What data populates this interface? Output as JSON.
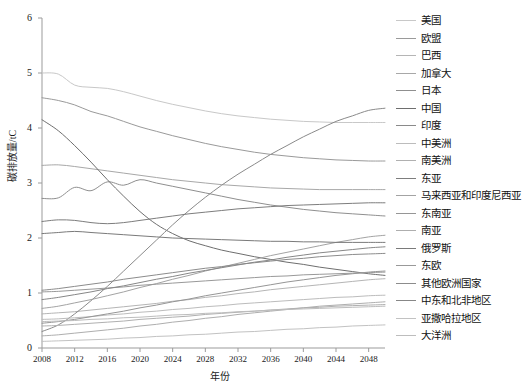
{
  "chart_data": {
    "type": "line",
    "title": "",
    "xlabel": "年份",
    "ylabel": "碳排放量/tC",
    "xlim": [
      2008,
      2050
    ],
    "ylim": [
      0,
      6
    ],
    "grid": false,
    "legend_position": "right",
    "xticks": [
      "2008",
      "2012",
      "2016",
      "2020",
      "2024",
      "2028",
      "2032",
      "2036",
      "2040",
      "2044",
      "2048"
    ],
    "yticks": [
      "0",
      "1",
      "2",
      "3",
      "4",
      "5",
      "6"
    ],
    "x": [
      2008,
      2010,
      2012,
      2014,
      2016,
      2018,
      2020,
      2022,
      2024,
      2026,
      2028,
      2030,
      2032,
      2034,
      2036,
      2038,
      2040,
      2042,
      2044,
      2046,
      2048,
      2050
    ],
    "series": [
      {
        "name": "美国",
        "color": "#c8c8c8",
        "values": [
          5.0,
          4.98,
          4.78,
          4.74,
          4.72,
          4.66,
          4.58,
          4.5,
          4.43,
          4.37,
          4.31,
          4.26,
          4.22,
          4.19,
          4.16,
          4.14,
          4.12,
          4.11,
          4.1,
          4.1,
          4.1,
          4.1
        ]
      },
      {
        "name": "欧盟",
        "color": "#9a9a9a",
        "values": [
          4.55,
          4.5,
          4.42,
          4.3,
          4.22,
          4.12,
          4.02,
          3.94,
          3.86,
          3.79,
          3.72,
          3.66,
          3.61,
          3.56,
          3.52,
          3.49,
          3.46,
          3.44,
          3.42,
          3.41,
          3.4,
          3.4
        ]
      },
      {
        "name": "巴西",
        "color": "#b5b5b5",
        "values": [
          0.62,
          0.64,
          0.66,
          0.69,
          0.72,
          0.75,
          0.78,
          0.81,
          0.85,
          0.88,
          0.92,
          0.95,
          0.99,
          1.02,
          1.06,
          1.09,
          1.12,
          1.15,
          1.18,
          1.21,
          1.24,
          1.26
        ]
      },
      {
        "name": "加拿大",
        "color": "#a8a8a8",
        "values": [
          3.32,
          3.33,
          3.3,
          3.26,
          3.22,
          3.18,
          3.14,
          3.1,
          3.06,
          3.03,
          3.0,
          2.97,
          2.95,
          2.93,
          2.91,
          2.9,
          2.89,
          2.88,
          2.88,
          2.88,
          2.88,
          2.88
        ]
      },
      {
        "name": "日本",
        "color": "#8f8f8f",
        "values": [
          2.72,
          2.73,
          2.92,
          2.86,
          3.02,
          2.96,
          3.06,
          3.0,
          2.94,
          2.88,
          2.82,
          2.76,
          2.7,
          2.65,
          2.6,
          2.56,
          2.52,
          2.49,
          2.46,
          2.44,
          2.42,
          2.4
        ]
      },
      {
        "name": "中国",
        "color": "#6e6e6e",
        "values": [
          4.15,
          3.95,
          3.68,
          3.38,
          3.06,
          2.76,
          2.48,
          2.25,
          2.08,
          1.95,
          1.86,
          1.78,
          1.72,
          1.66,
          1.61,
          1.56,
          1.52,
          1.47,
          1.43,
          1.39,
          1.35,
          1.32
        ]
      },
      {
        "name": "印度",
        "color": "#8a8a8a",
        "values": [
          0.3,
          0.42,
          0.62,
          0.86,
          1.12,
          1.4,
          1.68,
          1.96,
          2.24,
          2.5,
          2.74,
          2.96,
          3.16,
          3.34,
          3.52,
          3.68,
          3.84,
          3.98,
          4.12,
          4.22,
          4.32,
          4.36
        ]
      },
      {
        "name": "中美洲",
        "color": "#bcbcbc",
        "values": [
          0.52,
          0.53,
          0.55,
          0.57,
          0.6,
          0.62,
          0.65,
          0.67,
          0.7,
          0.72,
          0.75,
          0.77,
          0.8,
          0.82,
          0.84,
          0.86,
          0.88,
          0.9,
          0.92,
          0.93,
          0.95,
          0.96
        ]
      },
      {
        "name": "南美洲",
        "color": "#b0b0b0",
        "values": [
          0.4,
          0.41,
          0.43,
          0.45,
          0.47,
          0.49,
          0.52,
          0.54,
          0.56,
          0.58,
          0.61,
          0.63,
          0.65,
          0.67,
          0.69,
          0.71,
          0.73,
          0.74,
          0.76,
          0.77,
          0.78,
          0.79
        ]
      },
      {
        "name": "东亚",
        "color": "#7d7d7d",
        "values": [
          2.3,
          2.33,
          2.32,
          2.28,
          2.26,
          2.28,
          2.32,
          2.36,
          2.4,
          2.44,
          2.47,
          2.5,
          2.53,
          2.55,
          2.57,
          2.59,
          2.6,
          2.61,
          2.62,
          2.63,
          2.64,
          2.64
        ]
      },
      {
        "name": "马来西亚和印度尼西亚",
        "color": "#a3a3a3",
        "values": [
          0.72,
          0.76,
          0.82,
          0.88,
          0.95,
          1.02,
          1.1,
          1.17,
          1.25,
          1.32,
          1.4,
          1.47,
          1.54,
          1.61,
          1.68,
          1.74,
          1.8,
          1.86,
          1.92,
          1.97,
          2.02,
          2.05
        ]
      },
      {
        "name": "东南亚",
        "color": "#969696",
        "values": [
          0.45,
          0.48,
          0.52,
          0.57,
          0.62,
          0.67,
          0.73,
          0.78,
          0.84,
          0.89,
          0.95,
          1.0,
          1.05,
          1.1,
          1.15,
          1.2,
          1.24,
          1.28,
          1.32,
          1.35,
          1.38,
          1.4
        ]
      },
      {
        "name": "南亚",
        "color": "#aeaeae",
        "values": [
          0.22,
          0.24,
          0.27,
          0.3,
          0.33,
          0.36,
          0.4,
          0.43,
          0.47,
          0.5,
          0.54,
          0.57,
          0.61,
          0.64,
          0.67,
          0.7,
          0.73,
          0.76,
          0.78,
          0.8,
          0.82,
          0.84
        ]
      },
      {
        "name": "俄罗斯",
        "color": "#7a7a7a",
        "values": [
          2.08,
          2.1,
          2.12,
          2.1,
          2.08,
          2.06,
          2.04,
          2.02,
          2.0,
          1.99,
          1.98,
          1.97,
          1.96,
          1.95,
          1.94,
          1.94,
          1.93,
          1.93,
          1.92,
          1.92,
          1.92,
          1.92
        ]
      },
      {
        "name": "东欧",
        "color": "#999999",
        "values": [
          1.02,
          1.03,
          1.05,
          1.07,
          1.09,
          1.11,
          1.14,
          1.16,
          1.18,
          1.2,
          1.22,
          1.24,
          1.26,
          1.28,
          1.3,
          1.31,
          1.33,
          1.34,
          1.35,
          1.36,
          1.37,
          1.38
        ]
      },
      {
        "name": "其他欧洲国家",
        "color": "#8c8c8c",
        "values": [
          1.05,
          1.08,
          1.12,
          1.16,
          1.2,
          1.25,
          1.29,
          1.33,
          1.37,
          1.41,
          1.45,
          1.48,
          1.52,
          1.55,
          1.58,
          1.61,
          1.63,
          1.66,
          1.68,
          1.7,
          1.71,
          1.72
        ]
      },
      {
        "name": "中东和北非地区",
        "color": "#878787",
        "values": [
          0.88,
          0.92,
          0.97,
          1.02,
          1.08,
          1.13,
          1.19,
          1.25,
          1.3,
          1.36,
          1.41,
          1.46,
          1.51,
          1.56,
          1.6,
          1.65,
          1.69,
          1.73,
          1.76,
          1.79,
          1.82,
          1.84
        ]
      },
      {
        "name": "亚撒哈拉地区",
        "color": "#c2c2c2",
        "values": [
          0.12,
          0.13,
          0.14,
          0.15,
          0.16,
          0.18,
          0.19,
          0.21,
          0.22,
          0.24,
          0.25,
          0.27,
          0.29,
          0.3,
          0.32,
          0.34,
          0.35,
          0.37,
          0.38,
          0.4,
          0.41,
          0.42
        ]
      },
      {
        "name": "大洋洲",
        "color": "#bdbdbd",
        "values": [
          0.48,
          0.49,
          0.5,
          0.52,
          0.53,
          0.55,
          0.56,
          0.58,
          0.6,
          0.61,
          0.63,
          0.64,
          0.66,
          0.67,
          0.69,
          0.7,
          0.71,
          0.72,
          0.73,
          0.74,
          0.75,
          0.76
        ]
      }
    ]
  }
}
